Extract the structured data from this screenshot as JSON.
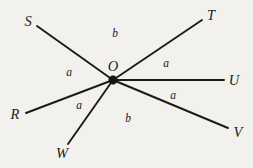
{
  "figure": {
    "background_color": "#f2f1ee",
    "line_color": "#1b1b1b",
    "vertex": {
      "name": "O",
      "label": "O",
      "label_x": 113,
      "label_y": 66,
      "x": 113,
      "y": 80,
      "dot_radius": 4.2
    },
    "rays": [
      {
        "name": "ray-OS",
        "label": "S",
        "x1": 113,
        "y1": 80,
        "x2": 37,
        "y2": 26,
        "label_x": 28,
        "label_y": 21
      },
      {
        "name": "ray-OT",
        "label": "T",
        "x1": 113,
        "y1": 80,
        "x2": 202,
        "y2": 20,
        "label_x": 211,
        "label_y": 15
      },
      {
        "name": "ray-OU",
        "label": "U",
        "x1": 113,
        "y1": 80,
        "x2": 224,
        "y2": 80,
        "label_x": 234,
        "label_y": 80
      },
      {
        "name": "ray-OV",
        "label": "V",
        "x1": 113,
        "y1": 80,
        "x2": 228,
        "y2": 128,
        "label_x": 238,
        "label_y": 132
      },
      {
        "name": "ray-OW",
        "label": "W",
        "x1": 113,
        "y1": 80,
        "x2": 68,
        "y2": 144,
        "label_x": 62,
        "label_y": 153
      },
      {
        "name": "ray-OR",
        "label": "R",
        "x1": 113,
        "y1": 80,
        "x2": 26,
        "y2": 113,
        "label_x": 15,
        "label_y": 114
      }
    ],
    "angles": [
      {
        "name": "angle-SOT",
        "label": "b",
        "x": 115,
        "y": 34,
        "between": [
          "S",
          "T"
        ]
      },
      {
        "name": "angle-TOU",
        "label": "a",
        "x": 166,
        "y": 64,
        "between": [
          "T",
          "U"
        ]
      },
      {
        "name": "angle-UOV",
        "label": "a",
        "x": 173,
        "y": 96,
        "between": [
          "U",
          "V"
        ]
      },
      {
        "name": "angle-VOW",
        "label": "b",
        "x": 128,
        "y": 119,
        "between": [
          "V",
          "W"
        ]
      },
      {
        "name": "angle-WOR",
        "label": "a",
        "x": 79,
        "y": 106,
        "between": [
          "W",
          "R"
        ]
      },
      {
        "name": "angle-ROS",
        "label": "a",
        "x": 69,
        "y": 73,
        "between": [
          "R",
          "S"
        ]
      }
    ]
  }
}
